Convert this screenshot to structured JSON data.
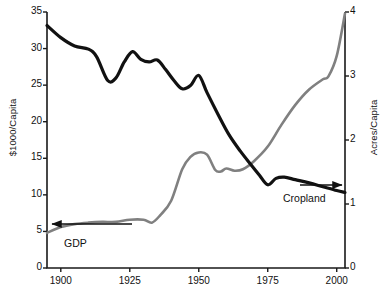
{
  "chart_data": {
    "type": "line",
    "title": "",
    "xlabel": "",
    "ylabel": "$1000/Capita",
    "y2label": "Acres/Capita",
    "xlim": [
      1895,
      2003
    ],
    "ylim": [
      0,
      35
    ],
    "y2lim": [
      0,
      4
    ],
    "grid": false,
    "legend": "inline-annotations",
    "x_ticks": [
      "1900",
      "1925",
      "1950",
      "1975",
      "2000"
    ],
    "x_tick_values": [
      1900,
      1925,
      1950,
      1975,
      2000
    ],
    "y_left_ticks": [
      "0",
      "5",
      "10",
      "15",
      "20",
      "25",
      "30",
      "35"
    ],
    "y_left_tick_values": [
      0,
      5,
      10,
      15,
      20,
      25,
      30,
      35
    ],
    "y_right_ticks": [
      "0",
      "1",
      "2",
      "3",
      "4"
    ],
    "y_right_tick_values": [
      0,
      1,
      2,
      3,
      4
    ],
    "series": [
      {
        "name": "GDP",
        "axis": "left",
        "color": "#808080",
        "units": "$1000/Capita",
        "x": [
          1895,
          1900,
          1905,
          1910,
          1915,
          1920,
          1925,
          1930,
          1933,
          1936,
          1940,
          1944,
          1947,
          1950,
          1953,
          1956,
          1958,
          1960,
          1963,
          1966,
          1970,
          1975,
          1980,
          1985,
          1990,
          1995,
          1997,
          2000,
          2003
        ],
        "values": [
          4.8,
          5.6,
          6.0,
          6.2,
          6.3,
          6.3,
          6.6,
          6.6,
          6.2,
          7.2,
          9.2,
          13.5,
          15.2,
          15.8,
          15.5,
          13.4,
          13.2,
          13.6,
          13.3,
          13.5,
          14.6,
          16.6,
          19.6,
          22.3,
          24.4,
          25.8,
          26.2,
          29.0,
          34.8
        ]
      },
      {
        "name": "Cropland",
        "axis": "right",
        "color": "#111111",
        "units": "Acres/Capita",
        "x": [
          1895,
          1900,
          1905,
          1910,
          1913,
          1917,
          1920,
          1923,
          1926,
          1929,
          1932,
          1935,
          1938,
          1941,
          1944,
          1947,
          1950,
          1953,
          1957,
          1961,
          1965,
          1969,
          1972,
          1975,
          1978,
          1981,
          1985,
          1990,
          1995,
          2000,
          2003
        ],
        "values": [
          3.79,
          3.6,
          3.47,
          3.42,
          3.3,
          2.93,
          2.97,
          3.22,
          3.38,
          3.26,
          3.22,
          3.25,
          3.1,
          2.93,
          2.8,
          2.85,
          3.01,
          2.74,
          2.4,
          2.08,
          1.83,
          1.61,
          1.45,
          1.3,
          1.4,
          1.42,
          1.38,
          1.33,
          1.27,
          1.21,
          1.18
        ]
      }
    ],
    "annotations": [
      {
        "text": "GDP",
        "arrow": "left",
        "points_to": "left-axis"
      },
      {
        "text": "Cropland",
        "arrow": "right",
        "points_to": "right-axis"
      }
    ]
  },
  "axes": {
    "left": {
      "title": "$1000/Capita"
    },
    "right": {
      "title": "Acres/Capita"
    }
  },
  "labels": {
    "gdp": "GDP",
    "cropland": "Cropland"
  },
  "colors": {
    "gdp_line": "#808080",
    "cropland_line": "#111111",
    "axis": "#1a1a1a",
    "background": "#ffffff"
  }
}
